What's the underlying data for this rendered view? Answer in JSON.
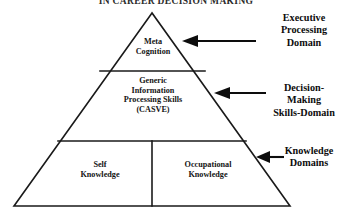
{
  "figure": {
    "title": "IN CAREER DECISION MAKING",
    "background_color": "#ffffff",
    "line_color": "#1a1a1a"
  },
  "pyramid": {
    "tiers": [
      {
        "id": "metacognition",
        "label": "Meta\nCognition",
        "position": "apex"
      },
      {
        "id": "casve",
        "label": "Generic\nInformation\nProcessing Skills\n(CASVE)",
        "position": "middle"
      },
      {
        "id": "self-knowledge",
        "label": "Self\nKnowledge",
        "position": "base-left"
      },
      {
        "id": "occupational-knowledge",
        "label": "Occupational\nKnowledge",
        "position": "base-right"
      }
    ]
  },
  "callouts": [
    {
      "id": "executive-processing-domain",
      "label": "Executive\nProcessing\nDomain",
      "arrow": "left-arrow-icon",
      "points_to": "metacognition"
    },
    {
      "id": "decision-making-skills-domain",
      "label": "Decision-\nMaking\nSkills-Domain",
      "arrow": "left-arrow-icon",
      "points_to": "casve"
    },
    {
      "id": "knowledge-domains",
      "label": "Knowledge\nDomains",
      "arrow": "left-arrow-icon",
      "points_to": "base-tier"
    }
  ]
}
